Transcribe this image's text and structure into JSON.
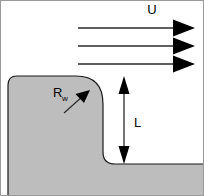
{
  "figure": {
    "type": "technical-schematic",
    "width": 204,
    "height": 196,
    "background_color": "#ffffff",
    "border_color": "#9a9a9a"
  },
  "labels": {
    "velocity": {
      "text": "U",
      "meaning": "free-stream velocity",
      "x": 152,
      "y": 14
    },
    "radius": {
      "base": "R",
      "subscript": "w",
      "meaning": "wall corner radius",
      "x": 53,
      "y": 97
    },
    "length": {
      "text": "L",
      "meaning": "step height",
      "x": 134,
      "y": 127
    }
  },
  "flow_arrows": {
    "count": 3,
    "direction": "right",
    "color": "#000000",
    "x_start": 78,
    "x_tip": 195,
    "head_length": 22,
    "head_half_width": 9,
    "y_positions": [
      28,
      46,
      64
    ]
  },
  "dimension_arrow": {
    "name": "L-dimension",
    "orientation": "vertical",
    "double_headed": true,
    "x": 124,
    "y_top": 76,
    "y_bottom": 164,
    "color": "#000000"
  },
  "pointer_arrow": {
    "name": "Rw-pointer",
    "from_x": 64,
    "from_y": 113,
    "to_x": 89,
    "to_y": 91,
    "color": "#000000"
  },
  "solid_body": {
    "name": "wall-solid",
    "fill_color": "#bdbdbd",
    "stroke_color": "#1a1a1a",
    "stroke_width": 1.2,
    "description": "Stepped wall: rounded upper-left corner, convex fillet at step crest, vertical wall face, concave fillet at base, floor extending right",
    "geometry": {
      "left_x": 8,
      "top_y": 76,
      "bottom_y": 196,
      "right_x": 204,
      "top_left_radius": 9,
      "crest_radius": 28,
      "step_face_x": 103,
      "floor_y": 164,
      "base_fillet_radius": 12
    }
  }
}
